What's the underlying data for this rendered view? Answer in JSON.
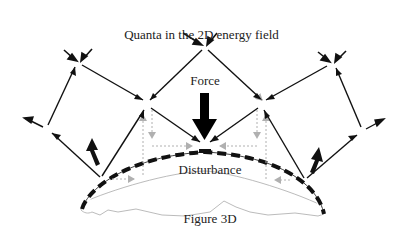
{
  "diagram": {
    "title": "Quanta in the 2D energy field",
    "labels": {
      "force": "Force",
      "disturbance": "Disturbance",
      "figure": "Figure 3D"
    },
    "colors": {
      "primary_line": "#111111",
      "secondary_dotted": "#b0b0b0",
      "figure_outline": "#aaaaaa",
      "dashed_boundary": "#111111",
      "background": "#ffffff"
    },
    "nodes": [
      {
        "id": "top-center",
        "x": 205,
        "y": 46
      },
      {
        "id": "left-upper",
        "x": 78,
        "y": 62
      },
      {
        "id": "right-upper",
        "x": 332,
        "y": 63
      },
      {
        "id": "left-mid",
        "x": 147,
        "y": 104
      },
      {
        "id": "right-mid",
        "x": 262,
        "y": 104
      },
      {
        "id": "bottom-center",
        "x": 205,
        "y": 146
      },
      {
        "id": "left-far",
        "x": 47,
        "y": 129
      },
      {
        "id": "right-far",
        "x": 362,
        "y": 131
      },
      {
        "id": "left-base",
        "x": 101,
        "y": 179
      },
      {
        "id": "right-base",
        "x": 305,
        "y": 181
      }
    ],
    "edges": [
      {
        "from": "top-center",
        "to": "left-mid",
        "type": "arrow"
      },
      {
        "from": "top-center",
        "to": "right-mid",
        "type": "arrow"
      },
      {
        "from": "left-upper",
        "to": "left-mid",
        "type": "arrow"
      },
      {
        "from": "right-upper",
        "to": "right-mid",
        "type": "arrow"
      },
      {
        "from": "left-mid",
        "to": "bottom-center",
        "type": "arrow"
      },
      {
        "from": "right-mid",
        "to": "bottom-center",
        "type": "arrow"
      },
      {
        "from": "left-base",
        "to": "left-mid",
        "type": "arrow"
      },
      {
        "from": "right-base",
        "to": "right-mid",
        "type": "arrow"
      },
      {
        "from": "left-base",
        "to": "left-far",
        "type": "arrow"
      },
      {
        "from": "right-base",
        "to": "right-far",
        "type": "arrow"
      },
      {
        "from": "left-far",
        "to": "left-upper",
        "type": "arrow"
      },
      {
        "from": "right-far",
        "to": "right-upper",
        "type": "arrow"
      }
    ]
  }
}
